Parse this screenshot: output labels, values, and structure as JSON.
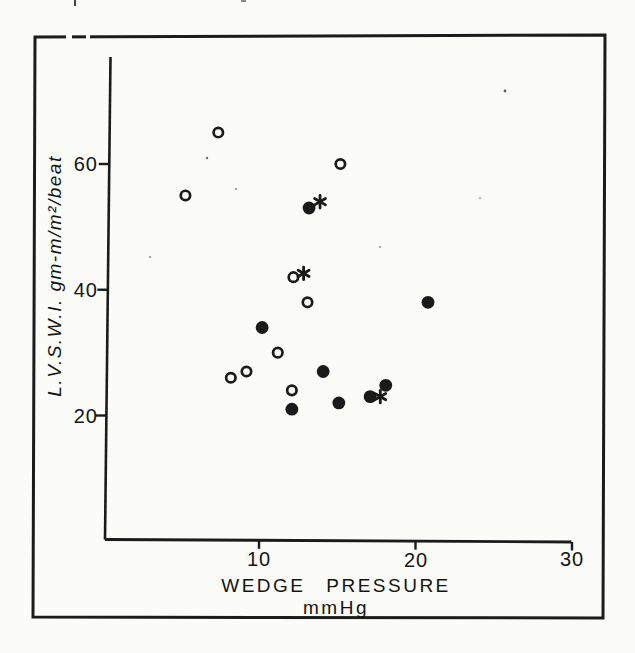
{
  "chart_data": {
    "type": "scatter",
    "title": "",
    "xlabel": "WEDGE PRESSURE mmHg",
    "ylabel": "L.V.S.W.I. gm-m/m²/beat",
    "xlim": [
      0,
      30
    ],
    "ylim": [
      0,
      77
    ],
    "grid": false,
    "legend": "none",
    "xticks": {
      "values": [
        10,
        20,
        30
      ],
      "labels": [
        "10",
        "20",
        "30"
      ]
    },
    "yticks": {
      "values": [
        20,
        40,
        60
      ],
      "labels": [
        "20",
        "40",
        "60"
      ]
    },
    "series": [
      {
        "name": "open-circles",
        "marker": "open-circle",
        "points": [
          [
            5.3,
            55
          ],
          [
            7.4,
            65
          ],
          [
            8.2,
            26
          ],
          [
            9.2,
            27
          ],
          [
            11.2,
            30
          ],
          [
            12.1,
            24
          ],
          [
            12.2,
            42
          ],
          [
            13.1,
            38
          ],
          [
            15.2,
            60
          ]
        ]
      },
      {
        "name": "filled-circles",
        "marker": "filled-circle",
        "points": [
          [
            10.2,
            34
          ],
          [
            12.1,
            21
          ],
          [
            13.2,
            53
          ],
          [
            14.1,
            27
          ],
          [
            15.1,
            22
          ],
          [
            17.1,
            23
          ],
          [
            18.1,
            24.8
          ],
          [
            20.8,
            38
          ]
        ]
      },
      {
        "name": "asterisks",
        "marker": "asterisk",
        "points": [
          [
            13.9,
            54
          ],
          [
            12.85,
            42.6
          ],
          [
            17.75,
            23
          ]
        ]
      }
    ],
    "colors": {
      "ink": "#1a1a1a",
      "paper": "#fbfbf7"
    }
  }
}
